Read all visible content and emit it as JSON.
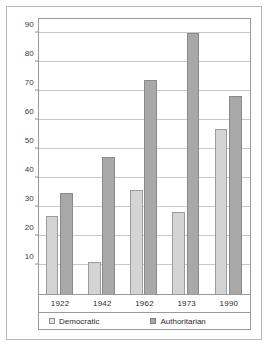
{
  "chart_data": {
    "type": "bar",
    "title": "",
    "xlabel": "",
    "ylabel": "Number of nations",
    "categories": [
      "1922",
      "1942",
      "1962",
      "1973",
      "1990"
    ],
    "series": [
      {
        "name": "Democratic",
        "values": [
          27,
          11,
          36,
          28.5,
          57
        ],
        "color": "#d4d4d4"
      },
      {
        "name": "Authoritarian",
        "values": [
          35,
          47.5,
          74,
          90,
          68.5
        ],
        "color": "#a8a8a8"
      }
    ],
    "ylim": [
      0,
      95
    ],
    "yticks": [
      10,
      20,
      30,
      40,
      50,
      60,
      70,
      80,
      90
    ],
    "ytick_labels": [
      "10",
      "20",
      "30",
      "40",
      "50",
      "60",
      "70",
      "80",
      "90"
    ],
    "grid": true,
    "legend_position": "bottom"
  },
  "legend": {
    "democratic_label": "Democratic",
    "authoritarian_label": "Authoritarian",
    "democratic_swatch": "democratic-swatch-icon",
    "authoritarian_swatch": "authoritarian-swatch-icon"
  }
}
